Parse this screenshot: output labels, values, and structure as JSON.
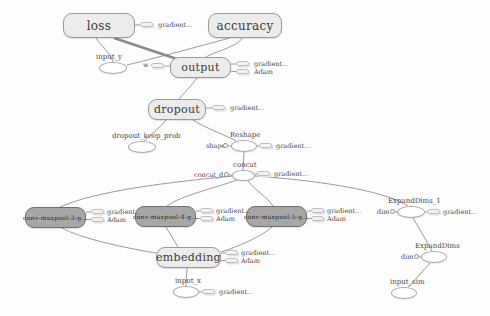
{
  "graph": {
    "title": "tensorflow-computation-graph",
    "colors": {
      "namespace_fill": "#ececec",
      "namespace_border": "#9a9a9a",
      "conv_fill": "#a7a7a7",
      "conv_border": "#6f6f6f",
      "op_fill": "#ffffff",
      "op_border": "#a8a8a8",
      "edge": "#9b9b9b",
      "edge_thick": "#8a8a8a",
      "text": "#3b3b3b"
    },
    "namespace_nodes": [
      {
        "id": "loss",
        "label": "loss"
      },
      {
        "id": "accuracy",
        "label": "accuracy"
      },
      {
        "id": "output",
        "label": "output"
      },
      {
        "id": "dropout",
        "label": "dropout"
      },
      {
        "id": "embedding",
        "label": "embedding"
      },
      {
        "id": "conv-maxpool-3",
        "label": "conv-maxpool-3-g..."
      },
      {
        "id": "conv-maxpool-4",
        "label": "conv-maxpool-4-g..."
      },
      {
        "id": "conv-maxpool-5",
        "label": "conv-maxpool-5-g..."
      }
    ],
    "op_nodes": [
      {
        "id": "input_y",
        "label": "input_y"
      },
      {
        "id": "dropout_keep_prob",
        "label": "dropout_keep_prob"
      },
      {
        "id": "reshape",
        "label": "Reshape"
      },
      {
        "id": "concat",
        "label": "concat"
      },
      {
        "id": "expanddims_1",
        "label": "ExpandDims_1"
      },
      {
        "id": "expanddims",
        "label": "ExpandDims"
      },
      {
        "id": "input_x",
        "label": "input_x"
      },
      {
        "id": "input_sim",
        "label": "input_sim"
      }
    ],
    "const_labels": {
      "w": "w",
      "shape": "shape",
      "concat_d": "concat_d...",
      "dim": "dim"
    },
    "summary_labels": {
      "gradient": "gradient...",
      "adam": "Adam"
    }
  }
}
